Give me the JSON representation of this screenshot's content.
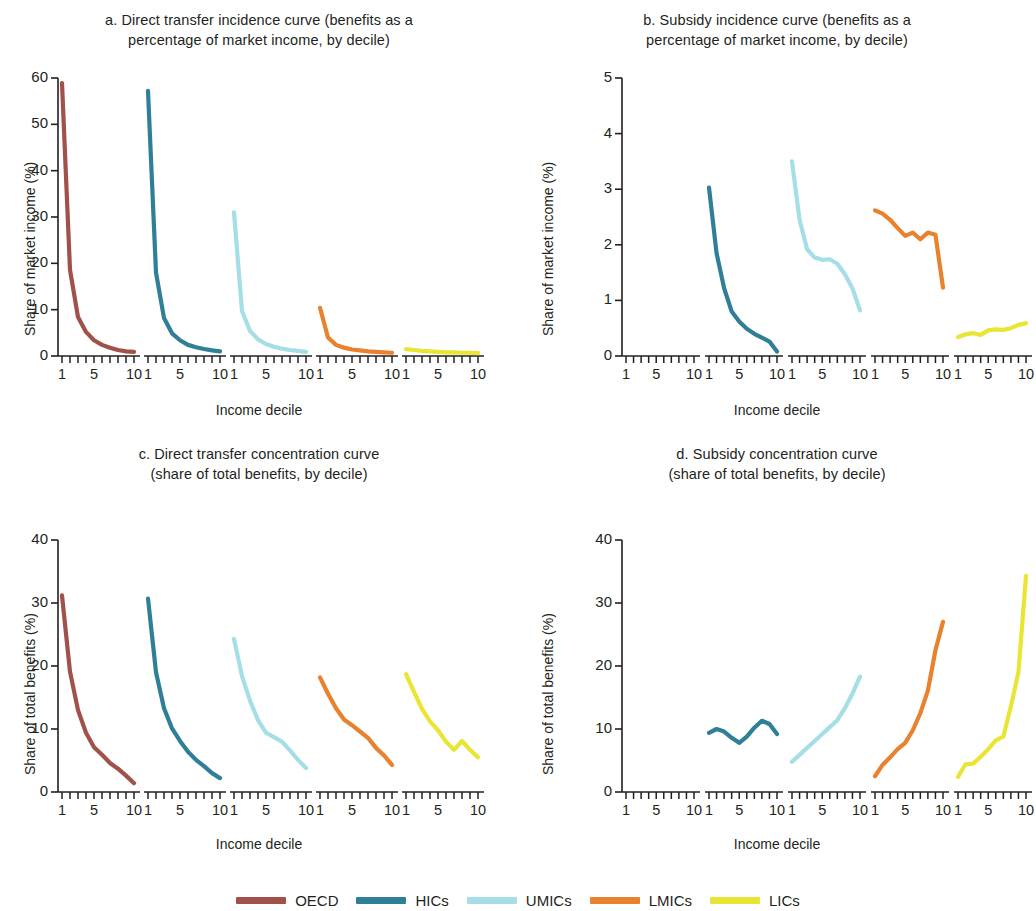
{
  "figure": {
    "xlabel": "Income decile",
    "series_order": [
      "OECD",
      "HICs",
      "UMICs",
      "LMICs",
      "LICs"
    ],
    "colors": {
      "OECD": "#a0514a",
      "HICs": "#2f7f97",
      "UMICs": "#a6dee7",
      "LMICs": "#e9822f",
      "LICs": "#e9e535"
    }
  },
  "legend": {
    "items": [
      {
        "label": "OECD",
        "color": "#a0514a"
      },
      {
        "label": "HICs",
        "color": "#2f7f97"
      },
      {
        "label": "UMICs",
        "color": "#a6dee7"
      },
      {
        "label": "LMICs",
        "color": "#e9822f"
      },
      {
        "label": "LICs",
        "color": "#e9e535"
      }
    ]
  },
  "chart_data": [
    {
      "id": "panel-a",
      "type": "line",
      "panel_letter": "a",
      "title": "a. Direct transfer incidence curve (benefits as a\npercentage of market income, by decile)",
      "xlabel": "Income decile",
      "ylabel": "Share of market income (%)",
      "ylim": [
        0,
        60
      ],
      "yticks": [
        0,
        10,
        20,
        30,
        40,
        50,
        60
      ],
      "xticks": [
        1,
        5,
        10
      ],
      "x": [
        1,
        2,
        3,
        4,
        5,
        6,
        7,
        8,
        9,
        10
      ],
      "grid": false,
      "legend_position": "bottom",
      "series": [
        {
          "name": "OECD",
          "values": [
            58.9,
            18.6,
            8.4,
            5.2,
            3.4,
            2.4,
            1.8,
            1.3,
            1.0,
            0.9
          ]
        },
        {
          "name": "HICs",
          "values": [
            57.2,
            18.0,
            8.2,
            4.9,
            3.4,
            2.4,
            1.9,
            1.5,
            1.2,
            1.0
          ]
        },
        {
          "name": "UMICs",
          "values": [
            31.0,
            9.7,
            5.4,
            3.6,
            2.6,
            2.0,
            1.6,
            1.3,
            1.1,
            0.9
          ]
        },
        {
          "name": "LMICs",
          "values": [
            10.4,
            4.0,
            2.4,
            1.8,
            1.4,
            1.2,
            1.0,
            0.9,
            0.8,
            0.7
          ]
        },
        {
          "name": "LICs",
          "values": [
            1.5,
            1.3,
            1.1,
            1.0,
            0.9,
            0.8,
            0.8,
            0.7,
            0.7,
            0.6
          ]
        }
      ]
    },
    {
      "id": "panel-b",
      "type": "line",
      "panel_letter": "b",
      "title": "b. Subsidy incidence curve (benefits as a\npercentage of market income, by decile)",
      "xlabel": "Income decile",
      "ylabel": "Share of market income (%)",
      "ylim": [
        0,
        5
      ],
      "yticks": [
        0,
        1,
        2,
        3,
        4,
        5
      ],
      "xticks": [
        1,
        5,
        10
      ],
      "x": [
        1,
        2,
        3,
        4,
        5,
        6,
        7,
        8,
        9,
        10
      ],
      "grid": false,
      "legend_position": "bottom",
      "series": [
        {
          "name": "OECD",
          "values": []
        },
        {
          "name": "HICs",
          "values": [
            3.03,
            1.85,
            1.22,
            0.8,
            0.62,
            0.49,
            0.4,
            0.33,
            0.26,
            0.08
          ]
        },
        {
          "name": "UMICs",
          "values": [
            3.5,
            2.45,
            1.92,
            1.77,
            1.73,
            1.74,
            1.66,
            1.47,
            1.22,
            0.82
          ]
        },
        {
          "name": "LMICs",
          "values": [
            2.62,
            2.56,
            2.45,
            2.3,
            2.16,
            2.22,
            2.1,
            2.22,
            2.18,
            1.23
          ]
        },
        {
          "name": "LICs",
          "values": [
            0.34,
            0.39,
            0.41,
            0.38,
            0.46,
            0.48,
            0.47,
            0.5,
            0.56,
            0.59
          ]
        }
      ]
    },
    {
      "id": "panel-c",
      "type": "line",
      "panel_letter": "c",
      "title": "c. Direct transfer concentration curve\n(share of total benefits, by decile)",
      "xlabel": "Income decile",
      "ylabel": "Share of total benefits (%)",
      "ylim": [
        0,
        40
      ],
      "yticks": [
        0,
        10,
        20,
        30,
        40
      ],
      "xticks": [
        1,
        5,
        10
      ],
      "x": [
        1,
        2,
        3,
        4,
        5,
        6,
        7,
        8,
        9,
        10
      ],
      "grid": false,
      "legend_position": "bottom",
      "series": [
        {
          "name": "OECD",
          "values": [
            31.2,
            19.1,
            13.0,
            9.4,
            7.1,
            5.9,
            4.6,
            3.7,
            2.6,
            1.4
          ]
        },
        {
          "name": "HICs",
          "values": [
            30.7,
            19.0,
            13.3,
            10.1,
            8.1,
            6.4,
            5.1,
            4.1,
            3.0,
            2.2
          ]
        },
        {
          "name": "UMICs",
          "values": [
            24.3,
            18.4,
            14.5,
            11.4,
            9.4,
            8.7,
            8.0,
            6.6,
            5.1,
            3.8
          ]
        },
        {
          "name": "LMICs",
          "values": [
            18.2,
            15.6,
            13.3,
            11.5,
            10.6,
            9.6,
            8.6,
            7.0,
            5.8,
            4.3
          ]
        },
        {
          "name": "LICs",
          "values": [
            18.7,
            15.9,
            13.2,
            11.2,
            9.8,
            8.0,
            6.7,
            8.1,
            6.7,
            5.5
          ]
        }
      ]
    },
    {
      "id": "panel-d",
      "type": "line",
      "panel_letter": "d",
      "title": "d. Subsidy concentration curve\n(share of total benefits, by decile)",
      "xlabel": "Income decile",
      "ylabel": "Share of total benefits (%)",
      "ylim": [
        0,
        40
      ],
      "yticks": [
        0,
        10,
        20,
        30,
        40
      ],
      "xticks": [
        1,
        5,
        10
      ],
      "x": [
        1,
        2,
        3,
        4,
        5,
        6,
        7,
        8,
        9,
        10
      ],
      "grid": false,
      "legend_position": "bottom",
      "series": [
        {
          "name": "OECD",
          "values": []
        },
        {
          "name": "HICs",
          "values": [
            9.4,
            10.0,
            9.6,
            8.6,
            7.8,
            8.8,
            10.2,
            11.3,
            10.8,
            9.2
          ]
        },
        {
          "name": "UMICs",
          "values": [
            4.8,
            5.9,
            7.0,
            8.1,
            9.2,
            10.3,
            11.4,
            13.3,
            15.6,
            18.3
          ]
        },
        {
          "name": "LMICs",
          "values": [
            2.5,
            4.3,
            5.5,
            6.8,
            7.8,
            9.8,
            12.5,
            16.1,
            22.5,
            27.0
          ]
        },
        {
          "name": "LICs",
          "values": [
            2.4,
            4.4,
            4.5,
            5.6,
            6.8,
            8.2,
            8.8,
            13.6,
            19.0,
            34.3
          ]
        }
      ]
    }
  ]
}
